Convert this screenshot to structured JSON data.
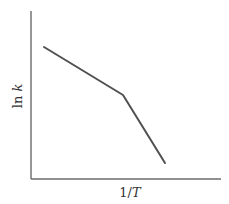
{
  "chart_data": {
    "type": "line",
    "title": "",
    "xlabel": "1/T",
    "ylabel": "ln k",
    "grid": false,
    "legend": null,
    "ticks": {
      "x": [],
      "y": []
    },
    "axis_px": {
      "origin": [
        31,
        179
      ],
      "x_end": 221,
      "y_top": 11
    },
    "series": [
      {
        "name": "ln k vs 1/T",
        "color": "#505050",
        "points_px": [
          [
            44,
            47
          ],
          [
            123,
            95
          ],
          [
            165,
            163
          ]
        ],
        "x": [
          0.07,
          0.48,
          0.71
        ],
        "y": [
          0.78,
          0.5,
          0.1
        ]
      }
    ],
    "annotations": [
      "Break in slope (two linear regimes)"
    ]
  },
  "labels": {
    "x_main": "1/",
    "x_var": "T",
    "y_main": "ln ",
    "y_var": "k"
  }
}
